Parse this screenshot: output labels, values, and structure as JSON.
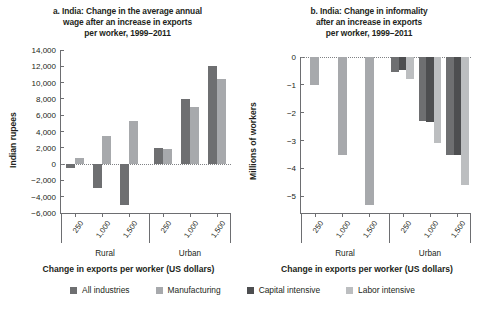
{
  "figure": {
    "xaxis_title": "Change in exports per worker (US dollars)",
    "group_labels": [
      "Rural",
      "Urban"
    ],
    "xtick_labels": [
      "250",
      "1,000",
      "1,500"
    ]
  },
  "legend": {
    "items": [
      {
        "label": "All industries",
        "color": "#6e6f71"
      },
      {
        "label": "Manufacturing",
        "color": "#a7a9ac"
      },
      {
        "label": "Capital intensive",
        "color": "#4d4e50"
      },
      {
        "label": "Labor intensive",
        "color": "#bcbec0"
      }
    ]
  },
  "chart_data": [
    {
      "id": "panel-a",
      "type": "bar",
      "title": "a. India: Change in the average annual wage after an increase in exports per worker, 1999–2011",
      "title_lines": [
        "a. India: Change in the average annual",
        "wage after an increase in exports",
        "per worker, 1999–2011"
      ],
      "xlabel": "Change in exports per worker (US dollars)",
      "ylabel": "Indian rupees",
      "ylim": [
        -6000,
        14000
      ],
      "yticks": [
        14000,
        12000,
        10000,
        8000,
        6000,
        4000,
        2000,
        0,
        -2000,
        -4000,
        -6000
      ],
      "ytick_labels": [
        "14,000",
        "12,000",
        "10,000",
        "8,000",
        "6,000",
        "4,000",
        "2,000",
        "0",
        "−2,000",
        "−4,000",
        "−6,000"
      ],
      "grid": false,
      "zero_line": true,
      "groups": [
        "Rural",
        "Urban"
      ],
      "categories": [
        "250",
        "1,000",
        "1,500",
        "250",
        "1,000",
        "1,500"
      ],
      "series": [
        {
          "name": "All industries",
          "color": "#6e6f71",
          "values": [
            -500,
            -2900,
            -5000,
            2000,
            8000,
            12000
          ]
        },
        {
          "name": "Manufacturing",
          "color": "#a7a9ac",
          "values": [
            700,
            3500,
            5300,
            1800,
            7000,
            10500
          ]
        }
      ]
    },
    {
      "id": "panel-b",
      "type": "bar",
      "title": "b. India: Change in informality after an increase in exports per worker, 1999–2011",
      "title_lines": [
        "b. India: Change in informality",
        "after an increase in exports",
        "per worker, 1999–2011"
      ],
      "xlabel": "Change in exports per worker (US dollars)",
      "ylabel": "Millions of workers",
      "ylim": [
        -5.6,
        0
      ],
      "yticks": [
        0,
        -1,
        -2,
        -3,
        -4,
        -5
      ],
      "ytick_labels": [
        "0",
        "−1",
        "−2",
        "−3",
        "−4",
        "−5"
      ],
      "grid": false,
      "zero_line": true,
      "groups": [
        "Rural",
        "Urban"
      ],
      "categories": [
        "250",
        "1,000",
        "1,500",
        "250",
        "1,000",
        "1,500"
      ],
      "series": [
        {
          "name": "Manufacturing",
          "color": "#a7a9ac",
          "values": [
            -1.0,
            -3.5,
            -5.3,
            null,
            null,
            null
          ]
        },
        {
          "name": "All industries",
          "color": "#6e6f71",
          "values": [
            null,
            null,
            null,
            -0.55,
            -2.3,
            -3.5
          ]
        },
        {
          "name": "Capital intensive",
          "color": "#4d4e50",
          "values": [
            null,
            null,
            null,
            -0.45,
            -2.35,
            -3.5
          ]
        },
        {
          "name": "Labor intensive",
          "color": "#bcbec0",
          "values": [
            null,
            null,
            null,
            -0.8,
            -3.1,
            -4.6
          ]
        }
      ]
    }
  ]
}
